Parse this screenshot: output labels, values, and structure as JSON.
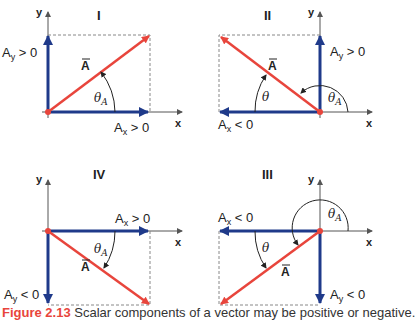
{
  "colors": {
    "vector": "#e8453c",
    "component": "#1f3a8a",
    "axis": "#555555",
    "dashed": "#888888"
  },
  "axes": {
    "x_label": "x",
    "y_label": "y"
  },
  "vector_label": "A",
  "quadrants": [
    {
      "id": "I",
      "label": "I",
      "ax_label": "A",
      "ax_sub": "x",
      "ax_rel": " > 0",
      "ay_label": "A",
      "ay_sub": "y",
      "ay_rel": " > 0",
      "theta_a": "θ",
      "theta_a_sub": "A"
    },
    {
      "id": "II",
      "label": "II",
      "ax_label": "A",
      "ax_sub": "x",
      "ax_rel": " < 0",
      "ay_label": "A",
      "ay_sub": "y",
      "ay_rel": " > 0",
      "theta": "θ",
      "theta_a": "θ",
      "theta_a_sub": "A"
    },
    {
      "id": "IV",
      "label": "IV",
      "ax_label": "A",
      "ax_sub": "x",
      "ax_rel": " > 0",
      "ay_label": "A",
      "ay_sub": "y",
      "ay_rel": " < 0",
      "theta_a": "θ",
      "theta_a_sub": "A"
    },
    {
      "id": "III",
      "label": "III",
      "ax_label": "A",
      "ax_sub": "x",
      "ax_rel": " < 0",
      "ay_label": "A",
      "ay_sub": "y",
      "ay_rel": " < 0",
      "theta": "θ",
      "theta_a": "θ",
      "theta_a_sub": "A"
    }
  ],
  "caption": {
    "figure": "Figure 2.13",
    "text": " Scalar components of a vector may be positive or negative."
  }
}
